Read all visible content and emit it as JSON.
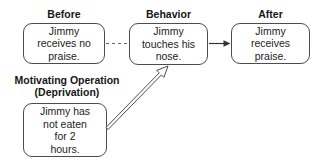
{
  "diagram": {
    "nodes": {
      "before": {
        "header": "Before",
        "text": "Jimmy\nreceives no\npraise."
      },
      "behavior": {
        "header": "Behavior",
        "text": "Jimmy\ntouches his\nnose."
      },
      "after": {
        "header": "After",
        "text": "Jimmy\nreceives\npraise."
      },
      "mo": {
        "header": "Motivating Operation\n(Deprivation)",
        "text": "Jimmy has\nnot eaten\nfor 2\nhours."
      }
    },
    "connectors": {
      "before_to_behavior": {
        "style": "dashed-line",
        "from": "before",
        "to": "behavior"
      },
      "behavior_to_after": {
        "style": "solid-filled-arrow",
        "from": "behavior",
        "to": "after"
      },
      "mo_to_behavior": {
        "style": "hollow-open-arrow",
        "from": "mo",
        "to": "behavior"
      }
    },
    "colors": {
      "background": "#ffffff",
      "box_border": "#4c4c4c",
      "text": "#1c1c1c",
      "connector": "#4c4c4c"
    }
  }
}
